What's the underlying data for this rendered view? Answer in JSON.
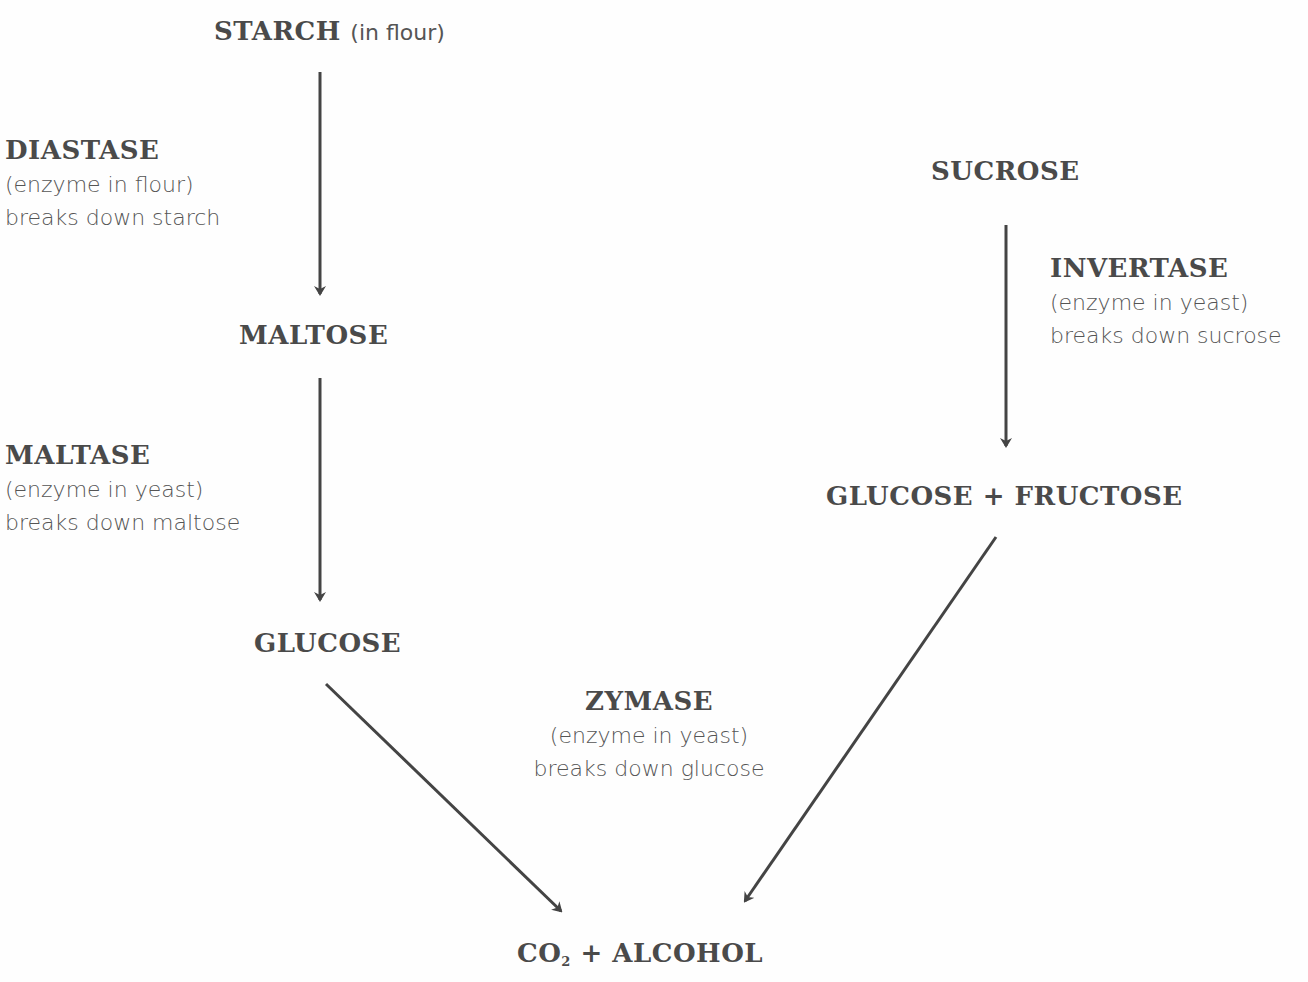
{
  "nodes": {
    "starch": {
      "label": "STARCH",
      "note": "(in flour)"
    },
    "maltose": {
      "label": "MALTOSE"
    },
    "glucose": {
      "label": "GLUCOSE"
    },
    "sucrose": {
      "label": "SUCROSE"
    },
    "glucose_fructose": {
      "label": "GLUCOSE + FRUCTOSE"
    },
    "products": {
      "label_prefix": "CO",
      "subscript": "2",
      "label_suffix": " + ALCOHOL"
    }
  },
  "enzymes": {
    "diastase": {
      "name": "DIASTASE",
      "line1": "(enzyme in flour)",
      "line2": "breaks down starch"
    },
    "maltase": {
      "name": "MALTASE",
      "line1": "(enzyme in yeast)",
      "line2": "breaks down maltose"
    },
    "invertase": {
      "name": "INVERTASE",
      "line1": "(enzyme in yeast)",
      "line2": "breaks down sucrose"
    },
    "zymase": {
      "name": "ZYMASE",
      "line1": "(enzyme in yeast)",
      "line2": "breaks down glucose"
    }
  },
  "colors": {
    "text": "#4a4a4a",
    "arrow": "#444444",
    "background": "#fefefe"
  }
}
